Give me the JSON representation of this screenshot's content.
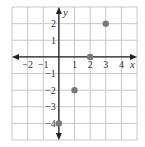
{
  "chart_data": {
    "type": "scatter",
    "title": "",
    "xlabel": "x",
    "ylabel": "y",
    "xlim": [
      -3,
      5
    ],
    "ylim": [
      -5,
      3
    ],
    "grid": true,
    "x_ticks": [
      -2,
      -1,
      1,
      2,
      3,
      4
    ],
    "y_ticks": [
      2,
      1,
      -1,
      -2,
      -3,
      -4
    ],
    "series": [
      {
        "name": "points",
        "points": [
          {
            "x": 0,
            "y": -4
          },
          {
            "x": 1,
            "y": -2
          },
          {
            "x": 2,
            "y": 0
          },
          {
            "x": 3,
            "y": 2
          }
        ]
      }
    ],
    "colors": {
      "grid": "#c8c8c8",
      "axis": "#222222",
      "point": "#7a7a7a"
    }
  }
}
